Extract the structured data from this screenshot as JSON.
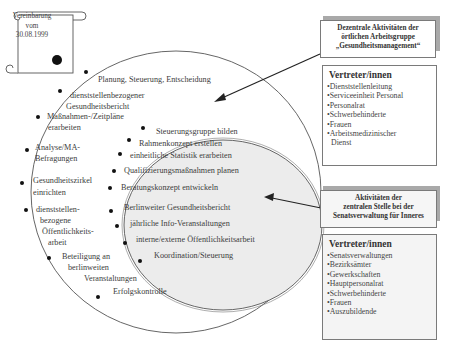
{
  "agreement": {
    "line1": "Vereinbarung",
    "line2": "vom",
    "date": "30.08.1999"
  },
  "outer_circle": {
    "items": [
      {
        "lines": [
          "Planung, Steuerung, Entscheidung"
        ]
      },
      {
        "lines": [
          "dienststellenbezogener",
          "Gesundheitsbericht"
        ]
      },
      {
        "lines": [
          "Maßnahmen-/Zeitpläne",
          "erarbeiten"
        ]
      },
      {
        "lines": [
          "Analyse/MA-",
          "Befragungen"
        ]
      },
      {
        "lines": [
          "Gesundheitszirkel",
          "einrichten"
        ]
      },
      {
        "lines": [
          "dienststellen-",
          "bezogene",
          "Öffentlichkeits-",
          "arbeit"
        ]
      },
      {
        "lines": [
          "Beteiligung an",
          "berlinweiten",
          "Veranstaltungen"
        ]
      },
      {
        "lines": [
          "Erfolgskontrolle"
        ]
      }
    ]
  },
  "inner_ellipse": {
    "fill": "#ececec",
    "items": [
      "Steuerungsgruppe bilden",
      "Rahmenkonzept erstellen",
      "einheitliche Statistik erarbeiten",
      "Qualifizierungsmaßnahmen planen",
      "Beratungskonzept entwickeln",
      "Berlinweiter Gesundheitsbericht",
      "jährliche Info-Veranstaltungen",
      "interne/externe Öffentlichkeitsarbeit",
      "Koordination/Steuerung"
    ]
  },
  "decentral_box": {
    "title_lines": [
      "Dezentrale Aktivitäten der",
      "örtlichen Arbeitsgruppe",
      "„Gesundheitsmanagement“"
    ]
  },
  "decentral_reps": {
    "title": "Vertreter/innen",
    "items": [
      "•Dienststellenleitung",
      "•Serviceeinheit Personal",
      "•Personalrat",
      "•Schwerbehinderte",
      "•Frauen",
      "•Arbeitsmedizinischer"
    ],
    "continuation": "Dienst"
  },
  "central_box": {
    "title_lines": [
      "Aktivitäten der",
      "zentralen Stelle bei der",
      "Senatsverwaltung für Inneres"
    ]
  },
  "central_reps": {
    "title": "Vertreter/innen",
    "items": [
      "•Senatsverwaltungen",
      "•Bezirksämter",
      "•Gewerkschaften",
      "•Hauptpersonalrat",
      "•Schwerbehinderte",
      "•Frauen",
      "•Auszubildende"
    ]
  }
}
